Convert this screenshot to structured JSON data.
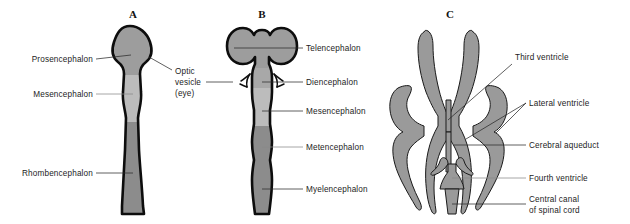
{
  "figure": {
    "background_color": "#ffffff",
    "panels": [
      {
        "id": "A",
        "letter": "A",
        "caption": "Three primary brain vesicles",
        "regions": [
          {
            "name": "prosencephalon",
            "label": "Prosencephalon",
            "fill": "#9d9d9d"
          },
          {
            "name": "mesencephalon",
            "label": "Mesencephalon",
            "fill": "#bcbcbc"
          },
          {
            "name": "rhombencephalon",
            "label": "Rhombencephalon",
            "fill": "#8c8c8c"
          }
        ]
      },
      {
        "id": "B",
        "letter": "B",
        "caption": "Five secondary brain vesicles",
        "regions": [
          {
            "name": "telencephalon",
            "label": "Telencephalon",
            "fill": "#9d9d9d"
          },
          {
            "name": "diencephalon",
            "label": "Diencephalon",
            "fill": "#a8a8a8"
          },
          {
            "name": "mesencephalon",
            "label": "Mesencephalon",
            "fill": "#bcbcbc"
          },
          {
            "name": "metencephalon",
            "label": "Metencephalon",
            "fill": "#8c8c8c"
          },
          {
            "name": "myelencephalon",
            "label": "Myelencephalon",
            "fill": "#8c8c8c"
          }
        ]
      },
      {
        "id": "C",
        "letter": "C",
        "caption": "Ventricular system",
        "regions": [
          {
            "name": "third-ventricle",
            "label": "Third ventricle",
            "fill": "#9a9a9a"
          },
          {
            "name": "lateral-ventricle",
            "label": "Lateral ventricle",
            "fill": "#9a9a9a"
          },
          {
            "name": "cerebral-aqueduct",
            "label": "Cerebral aqueduct",
            "fill": "#9a9a9a"
          },
          {
            "name": "fourth-ventricle",
            "label": "Fourth ventricle",
            "fill": "#9a9a9a"
          },
          {
            "name": "central-canal",
            "label": "Central canal\nof spinal cord",
            "fill": "#9a9a9a"
          }
        ]
      }
    ],
    "labels": {
      "prosencephalon": "Prosencephalon",
      "mesencephalon_a": "Mesencephalon",
      "rhombencephalon": "Rhombencephalon",
      "optic_vesicle_line1": "Optic",
      "optic_vesicle_line2": "vesicle",
      "optic_vesicle_line3": "(eye)",
      "telencephalon": "Telencephalon",
      "diencephalon": "Diencephalon",
      "mesencephalon_b": "Mesencephalon",
      "metencephalon": "Metencephalon",
      "myelencephalon": "Myelencephalon",
      "third_ventricle": "Third ventricle",
      "lateral_ventricle": "Lateral ventricle",
      "cerebral_aqueduct": "Cerebral aqueduct",
      "fourth_ventricle": "Fourth ventricle",
      "central_canal_line1": "Central canal",
      "central_canal_line2": "of spinal cord"
    },
    "colors": {
      "outline": "#0d0d0d",
      "leader": "#2b2b2b",
      "leader_light": "#8a8a8a",
      "gray_dark": "#8c8c8c",
      "gray_mid": "#9d9d9d",
      "gray_light": "#bcbcbc",
      "ventricle": "#9a9a9a",
      "text": "#1c1c1c"
    }
  }
}
